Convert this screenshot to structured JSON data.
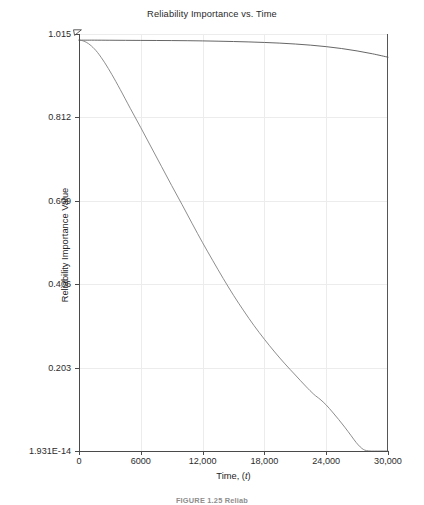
{
  "figure": {
    "caption": "FIGURE 1.25   Reliab",
    "background_color": "#ffffff"
  },
  "chart_data": {
    "type": "line",
    "title": "Reliability Importance vs. Time",
    "xlabel_text": "Time, (",
    "xlabel_italic": "t",
    "xlabel_tail": ")",
    "ylabel": "Reliability Importance Value",
    "grid": true,
    "legend": "none",
    "xlim": [
      0,
      30000
    ],
    "ylim": [
      1.931e-14,
      1.015
    ],
    "xticks": [
      0,
      6000,
      12000,
      18000,
      24000,
      30000
    ],
    "xticklabels": [
      "0",
      "6000",
      "12,000",
      "18,000",
      "24,000",
      "30,000"
    ],
    "yticks": [
      1.931e-14,
      0.203,
      0.406,
      0.609,
      0.812,
      1.015
    ],
    "yticklabels": [
      "1.931E-14",
      "0.203",
      "0.406",
      "0.609",
      "0.812",
      "1.015"
    ],
    "series": [
      {
        "name": "component-high-importance",
        "color": "#555555",
        "width": 0.9,
        "x": [
          0,
          600,
          1500,
          3000,
          4500,
          6000,
          7500,
          9000,
          10500,
          12000,
          13500,
          15000,
          16500,
          18000,
          19500,
          21000,
          22500,
          24000,
          25500,
          27000,
          28500,
          30000
        ],
        "y": [
          1.0,
          1.0,
          1.0,
          0.9998,
          0.9996,
          0.9994,
          0.9992,
          0.999,
          0.9987,
          0.9982,
          0.9975,
          0.9967,
          0.9957,
          0.9944,
          0.9928,
          0.9906,
          0.9878,
          0.9842,
          0.9796,
          0.9738,
          0.9668,
          0.9585
        ]
      },
      {
        "name": "component-declining-importance",
        "color": "#808080",
        "width": 0.9,
        "x": [
          0,
          300,
          700,
          1200,
          1800,
          2500,
          3200,
          4000,
          5000,
          6000,
          7000,
          8000,
          9000,
          10000,
          11000,
          12000,
          13000,
          14000,
          15000,
          16000,
          17000,
          18000,
          19000,
          20000,
          21000,
          22000,
          22800,
          23400,
          24000,
          24600,
          25200,
          25800,
          26400,
          26900,
          27300,
          27600,
          27900,
          28400,
          29000,
          30000
        ],
        "y": [
          1.0,
          0.999,
          0.995,
          0.986,
          0.97,
          0.945,
          0.916,
          0.88,
          0.833,
          0.787,
          0.74,
          0.693,
          0.646,
          0.6,
          0.553,
          0.507,
          0.463,
          0.42,
          0.379,
          0.341,
          0.305,
          0.272,
          0.241,
          0.212,
          0.185,
          0.158,
          0.138,
          0.126,
          0.112,
          0.095,
          0.077,
          0.058,
          0.038,
          0.021,
          0.01,
          0.004,
          0.001,
          0.0,
          0.0,
          0.0
        ]
      }
    ],
    "annotations": {
      "corner_marker": "axis-origin-arrow-marker"
    }
  }
}
